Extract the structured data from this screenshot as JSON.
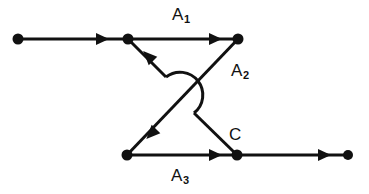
{
  "figure": {
    "type": "directed-graph-diagram",
    "width": 369,
    "height": 194,
    "background_color": "#ffffff",
    "stroke_color": "#111111",
    "labels": {
      "a1_base": "A",
      "a1_sub": "1",
      "a2_base": "A",
      "a2_sub": "2",
      "a3_base": "A",
      "a3_sub": "3",
      "c": "C"
    },
    "nodes": [
      {
        "id": "p0",
        "name": "left-endpoint",
        "x": 18,
        "y": 39
      },
      {
        "id": "p1",
        "name": "top-left-node",
        "x": 128,
        "y": 39
      },
      {
        "id": "p2",
        "name": "top-right-node",
        "x": 238,
        "y": 39
      },
      {
        "id": "p3",
        "name": "bottom-left-node",
        "x": 127,
        "y": 155
      },
      {
        "id": "p4",
        "name": "bottom-right-node",
        "x": 237,
        "y": 155
      },
      {
        "id": "p5",
        "name": "right-endpoint",
        "x": 348,
        "y": 155
      }
    ],
    "edges": [
      {
        "id": "e-lead-in",
        "name": "lead-in-edge",
        "from": "p0",
        "to": "p1",
        "label": null,
        "arrow_at": {
          "x": 95,
          "y": 39,
          "angle": 0
        }
      },
      {
        "id": "e-a1",
        "name": "edge-a1",
        "from": "p1",
        "to": "p2",
        "label": "A1",
        "arrow_at": {
          "x": 208,
          "y": 39,
          "angle": 0
        }
      },
      {
        "id": "e-a2",
        "name": "edge-a2",
        "from": "p2",
        "to": "p3",
        "label": "A2",
        "arrow_at": {
          "x": 155,
          "y": 128,
          "angle": 133.7
        }
      },
      {
        "id": "e-c",
        "name": "edge-c",
        "from": "p4",
        "to": "p1",
        "label": "C",
        "arrow_at": {
          "x": 152,
          "y": 60,
          "angle": 226.3
        }
      },
      {
        "id": "e-a3",
        "name": "edge-a3",
        "from": "p3",
        "to": "p4",
        "label": "A3",
        "arrow_at": {
          "x": 208,
          "y": 155,
          "angle": 0
        }
      },
      {
        "id": "e-lead-out",
        "name": "lead-out-edge",
        "from": "p4",
        "to": "p5",
        "label": null,
        "arrow_at": {
          "x": 317,
          "y": 155,
          "angle": 0
        }
      }
    ],
    "crossing_hop": {
      "name": "wire-hop-arc",
      "start": {
        "x": 166,
        "y": 77
      },
      "end": {
        "x": 194,
        "y": 113
      },
      "bulge_direction": "right"
    }
  }
}
